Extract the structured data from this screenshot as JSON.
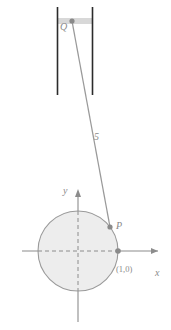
{
  "figure": {
    "type": "geometry-diagram",
    "width": 171,
    "height": 330
  },
  "labels": {
    "piston_point": "Q",
    "rod_length": "5",
    "circle_point": "P",
    "y_axis": "y",
    "x_axis": "x",
    "circle_x_intercept": "(1,0)"
  },
  "icons": {
    "y_axis_arrow": "arrow-up-icon",
    "x_axis_arrow": "arrow-right-icon",
    "point_q_marker": "point-marker-icon",
    "point_p_marker": "point-marker-icon",
    "point_one_zero_marker": "point-marker-icon"
  },
  "geometry": {
    "circle": {
      "cx": 78,
      "cy": 251,
      "r": 40,
      "radius_units": 1
    },
    "point_P": {
      "x": 110,
      "y": 227
    },
    "point_Q": {
      "x": 72,
      "y": 21
    },
    "point_1_0": {
      "x": 118,
      "y": 251
    },
    "rod": {
      "from": "Q",
      "to": "P",
      "length_label": "5"
    },
    "cylinder": {
      "left_wall_x": 57,
      "right_wall_x": 93,
      "top_y": 7,
      "bottom_y": 95,
      "piston_band_y": 18,
      "piston_band_height": 6
    },
    "x_axis": {
      "from_x": 22,
      "to_x": 160,
      "y": 251
    },
    "y_axis": {
      "x": 78,
      "from_y": 322,
      "to_y": 190
    },
    "dashed_horizontal_radius": {
      "from_x": 38,
      "to_x": 118,
      "y": 251
    },
    "dashed_vertical_radius": {
      "x": 78,
      "from_y": 211,
      "to_y": 291
    }
  },
  "colors": {
    "stroke_gray": "#8c8c8c",
    "circle_fill": "#ededed",
    "circle_stroke": "#9a9a9a",
    "cylinder_wall": "#2b2b2b",
    "piston_band": "#d8d8d8",
    "point_marker": "#8a8a8a",
    "label_text": "#8a8a8a",
    "background": "#ffffff"
  }
}
